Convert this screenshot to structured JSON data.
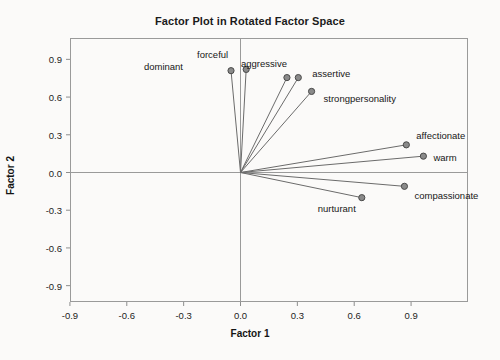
{
  "chart_data": {
    "type": "scatter",
    "title": "Factor Plot in Rotated Factor Space",
    "xlabel": "Factor 1",
    "ylabel": "Factor 2",
    "xlim": [
      -1.05,
      1.05
    ],
    "ylim": [
      -1.05,
      1.05
    ],
    "xticks": [
      "-0.9",
      "-0.6",
      "-0.3",
      "0.0",
      "0.3",
      "0.6",
      "0.9"
    ],
    "xtick_values": [
      -0.9,
      -0.6,
      -0.3,
      0.0,
      0.3,
      0.6,
      0.9
    ],
    "yticks": [
      "0.9",
      "0.6",
      "0.3",
      "0.0",
      "-0.3",
      "-0.6",
      "-0.9"
    ],
    "ytick_values": [
      0.9,
      0.6,
      0.3,
      0.0,
      -0.3,
      -0.6,
      -0.9
    ],
    "grid": false,
    "legend": "none",
    "draw_vectors": true,
    "marker_color": "#8a8a8a",
    "marker_edge_color": "#4a4a4a",
    "line_color": "#6b6b6b",
    "axis_color": "#9a9a9a",
    "points": [
      {
        "label": "dominant",
        "x": -0.05,
        "y": 0.81,
        "label_dx": -52,
        "label_dy": -4
      },
      {
        "label": "forceful",
        "x": 0.03,
        "y": 0.82,
        "label_dx": -22,
        "label_dy": -14
      },
      {
        "label": "aggressive",
        "x": 0.245,
        "y": 0.755,
        "label_dx": -4,
        "label_dy": -14
      },
      {
        "label": "assertive",
        "x": 0.305,
        "y": 0.755,
        "label_dx": 14,
        "label_dy": -4
      },
      {
        "label": "strongpersonality",
        "x": 0.375,
        "y": 0.645,
        "label_dx": 12,
        "label_dy": 8
      },
      {
        "label": "affectionate",
        "x": 0.875,
        "y": 0.22,
        "label_dx": 10,
        "label_dy": -9
      },
      {
        "label": "warm",
        "x": 0.965,
        "y": 0.13,
        "label_dx": 10,
        "label_dy": 2
      },
      {
        "label": "compassionate",
        "x": 0.865,
        "y": -0.11,
        "label_dx": 10,
        "label_dy": 10
      },
      {
        "label": "nurturant",
        "x": 0.64,
        "y": -0.2,
        "label_dx": -10,
        "label_dy": 11
      }
    ]
  }
}
